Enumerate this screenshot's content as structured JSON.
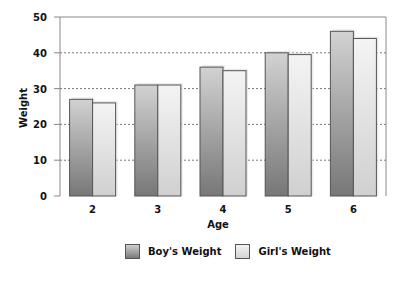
{
  "chart_data": {
    "type": "bar",
    "title": "",
    "xlabel": "Age",
    "ylabel": "Weight",
    "ylim": [
      0,
      50
    ],
    "yticks": [
      0,
      10,
      20,
      30,
      40,
      50
    ],
    "categories": [
      "2",
      "3",
      "4",
      "5",
      "6"
    ],
    "series": [
      {
        "name": "Boy's Weight",
        "values": [
          27,
          31,
          36,
          40,
          46
        ]
      },
      {
        "name": "Girl's Weight",
        "values": [
          26,
          31,
          35,
          39.5,
          44
        ]
      }
    ],
    "grid": "horizontal dotted",
    "legend_position": "bottom"
  },
  "legend": {
    "boy_label": "Boy's Weight",
    "girl_label": "Girl's Weight"
  },
  "colors": {
    "boy_top": "#cfcfcf",
    "boy_bottom": "#7a7a7a",
    "girl_top": "#f2f2f2",
    "girl_bottom": "#d4d4d4",
    "border": "#555555"
  }
}
